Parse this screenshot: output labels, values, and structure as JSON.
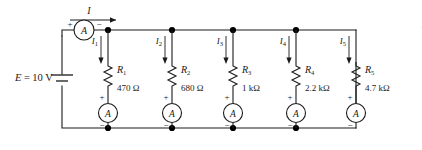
{
  "figure": {
    "source_credit": "© Cengage Learning 2013"
  },
  "source": {
    "label_symbol": "E",
    "label_equals": "=",
    "label_value": "10 V",
    "full_label": "E = 10 V",
    "type": "dc-battery"
  },
  "total_current": {
    "label": "I",
    "direction": "right"
  },
  "main_ammeter": {
    "glyph": "A",
    "plus": "+",
    "minus": "−"
  },
  "branches": [
    {
      "current_label": "I",
      "current_sub": "1",
      "resistor_label": "R",
      "resistor_sub": "1",
      "resistance": "470 Ω",
      "ammeter_glyph": "A",
      "plus": "+",
      "minus": "−"
    },
    {
      "current_label": "I",
      "current_sub": "2",
      "resistor_label": "R",
      "resistor_sub": "2",
      "resistance": "680 Ω",
      "ammeter_glyph": "A",
      "plus": "+",
      "minus": "−"
    },
    {
      "current_label": "I",
      "current_sub": "3",
      "resistor_label": "R",
      "resistor_sub": "3",
      "resistance": "1 kΩ",
      "ammeter_glyph": "A",
      "plus": "+",
      "minus": "−"
    },
    {
      "current_label": "I",
      "current_sub": "4",
      "resistor_label": "R",
      "resistor_sub": "4",
      "resistance": "2.2 kΩ",
      "ammeter_glyph": "A",
      "plus": "+",
      "minus": "−"
    },
    {
      "current_label": "I",
      "current_sub": "5",
      "resistor_label": "R",
      "resistor_sub": "5",
      "resistance": "4.7 kΩ",
      "ammeter_glyph": "A",
      "plus": "+",
      "minus": "−"
    }
  ],
  "colors": {
    "wire": "#1a1a1a",
    "node": "#000000",
    "text": "#1a1a1a",
    "background": "#ffffff"
  }
}
